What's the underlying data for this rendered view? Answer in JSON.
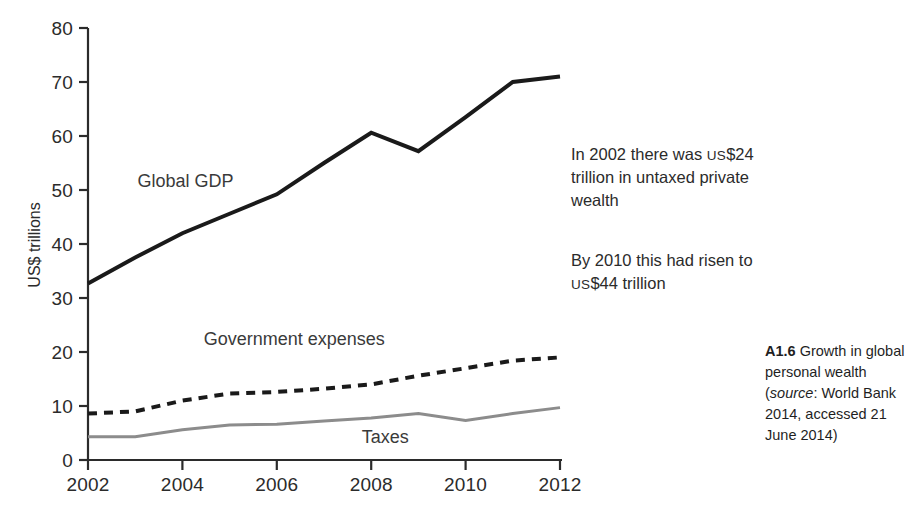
{
  "chart_data": {
    "type": "line",
    "title": "",
    "xlabel": "",
    "ylabel": "US$ trillions",
    "xlim": [
      2002,
      2012
    ],
    "ylim": [
      0,
      80
    ],
    "grid": false,
    "legend_position": "inline-labels",
    "x": [
      2002,
      2003,
      2004,
      2005,
      2006,
      2007,
      2008,
      2009,
      2010,
      2011,
      2012
    ],
    "x_ticks": [
      "2002",
      "2004",
      "2006",
      "2008",
      "2010",
      "2012"
    ],
    "x_tick_values": [
      2002,
      2004,
      2006,
      2008,
      2010,
      2012
    ],
    "y_ticks": [
      "0",
      "10",
      "20",
      "30",
      "40",
      "50",
      "60",
      "70",
      "80"
    ],
    "y_tick_values": [
      0,
      10,
      20,
      30,
      40,
      50,
      60,
      70,
      80
    ],
    "series": [
      {
        "name": "Global GDP",
        "style": "solid",
        "color": "#1a1a1a",
        "width": 4,
        "label_x": 2003.05,
        "label_y": 50.5,
        "values": [
          32.7,
          37.5,
          42.0,
          45.6,
          49.2,
          55.0,
          60.6,
          57.2,
          63.5,
          70.0,
          71.0
        ]
      },
      {
        "name": "Government expenses",
        "style": "dashed",
        "color": "#1a1a1a",
        "width": 4,
        "label_x": 2004.45,
        "label_y": 21.3,
        "values": [
          8.6,
          9.0,
          11.0,
          12.3,
          12.6,
          13.2,
          14.0,
          15.6,
          17.0,
          18.4,
          19.0
        ]
      },
      {
        "name": "Taxes",
        "style": "solid",
        "color": "#8c8c8c",
        "width": 3,
        "label_x": 2007.8,
        "label_y": 3.1,
        "values": [
          4.3,
          4.3,
          5.6,
          6.5,
          6.6,
          7.2,
          7.8,
          8.6,
          7.3,
          8.6,
          9.7
        ]
      }
    ]
  },
  "annotations": [
    {
      "id": "annotation-1",
      "lines": [
        {
          "parts": [
            {
              "text": "In 2002 there was "
            },
            {
              "text": "US",
              "smallcaps": true
            },
            {
              "text": "$24"
            }
          ]
        },
        {
          "parts": [
            {
              "text": "trillion in untaxed private"
            }
          ]
        },
        {
          "parts": [
            {
              "text": "wealth"
            }
          ]
        }
      ],
      "plain": "In 2002 there was US$24 trillion in untaxed private wealth"
    },
    {
      "id": "annotation-2",
      "lines": [
        {
          "parts": [
            {
              "text": "By 2010 this had risen to"
            }
          ]
        },
        {
          "parts": [
            {
              "text": "US",
              "smallcaps": true
            },
            {
              "text": "$44 trillion"
            }
          ]
        }
      ],
      "plain": "By 2010 this had risen to US$44 trillion"
    }
  ],
  "caption": {
    "figure_number": "A1.6",
    "text_before_source": " Growth in global personal wealth (",
    "source_word": "source",
    "text_after_source": ": World Bank 2014, accessed 21 June 2014)",
    "full": "A1.6 Growth in global personal wealth (source: World Bank 2014, accessed 21 June 2014)"
  },
  "colors": {
    "background": "#ffffff",
    "axis": "#2b2b2b",
    "gdp_line": "#1a1a1a",
    "expenses_line": "#1a1a1a",
    "taxes_line": "#8c8c8c",
    "text": "#2b2b2b"
  }
}
